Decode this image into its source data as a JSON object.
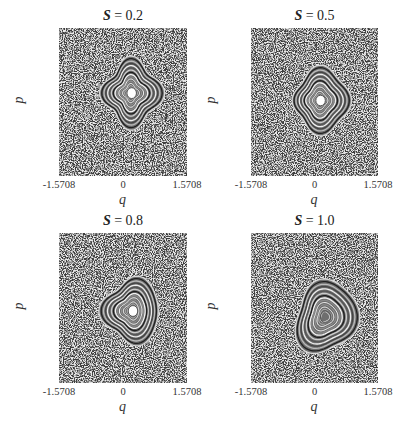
{
  "figure": {
    "panels": [
      {
        "title_symbol": "S",
        "title_eq": " = 0.2",
        "xlabel": "q",
        "ylabel": "p",
        "xticks": [
          "-1.5708",
          "0",
          "1.5708"
        ],
        "yticks": [
          "1.5708",
          "0",
          "-1.5708"
        ]
      },
      {
        "title_symbol": "S",
        "title_eq": " = 0.5",
        "xlabel": "q",
        "ylabel": "p",
        "xticks": [
          "-1.5708",
          "0",
          "1.5708"
        ],
        "yticks": [
          "1.5708",
          "0",
          "-1.5708"
        ]
      },
      {
        "title_symbol": "S",
        "title_eq": " = 0.8",
        "xlabel": "q",
        "ylabel": "p",
        "xticks": [
          "-1.5708",
          "0",
          "1.5708"
        ],
        "yticks": [
          "1.5708",
          "0",
          "-1.5708"
        ]
      },
      {
        "title_symbol": "S",
        "title_eq": " = 1.0",
        "xlabel": "q",
        "ylabel": "p",
        "xticks": [
          "-1.5708",
          "0",
          "1.5708"
        ],
        "yticks": [
          "1.5708",
          "0",
          "-1.5708"
        ]
      }
    ]
  },
  "chart_data": [
    {
      "type": "scatter",
      "title": "S = 0.2",
      "xlabel": "q",
      "ylabel": "p",
      "xlim": [
        -1.5708,
        1.5708
      ],
      "ylim": [
        -1.5708,
        1.5708
      ],
      "x_ticks": [
        -1.5708,
        0,
        1.5708
      ],
      "y_ticks": [
        -1.5708,
        0,
        1.5708
      ],
      "description": "Poincare section: chaotic sea with a regular island (nested invariant curves) centered near q=0.15, p=0.1",
      "island": {
        "center": [
          0.15,
          0.1
        ],
        "half_width": 0.55,
        "half_height": 0.6,
        "shape": "squarish with cusps at corners"
      }
    },
    {
      "type": "scatter",
      "title": "S = 0.5",
      "xlabel": "q",
      "ylabel": "p",
      "xlim": [
        -1.5708,
        1.5708
      ],
      "ylim": [
        -1.5708,
        1.5708
      ],
      "x_ticks": [
        -1.5708,
        0,
        1.5708
      ],
      "y_ticks": [
        -1.5708,
        0,
        1.5708
      ],
      "description": "Poincare section: chaotic sea with a regular island centered near q=0.1, p=0.0",
      "island": {
        "center": [
          0.1,
          0.0
        ],
        "half_width": 0.55,
        "half_height": 0.6,
        "shape": "D-shaped"
      }
    },
    {
      "type": "scatter",
      "title": "S = 0.8",
      "xlabel": "q",
      "ylabel": "p",
      "xlim": [
        -1.5708,
        1.5708
      ],
      "ylim": [
        -1.5708,
        1.5708
      ],
      "x_ticks": [
        -1.5708,
        0,
        1.5708
      ],
      "y_ticks": [
        -1.5708,
        0,
        1.5708
      ],
      "description": "Poincare section: chaotic sea with a regular island centered near q=0.2, p=-0.1",
      "island": {
        "center": [
          0.2,
          -0.1
        ],
        "half_width": 0.55,
        "half_height": 0.6,
        "shape": "rounded triangle"
      }
    },
    {
      "type": "scatter",
      "title": "S = 1.0",
      "xlabel": "q",
      "ylabel": "p",
      "xlim": [
        -1.5708,
        1.5708
      ],
      "ylim": [
        -1.5708,
        1.5708
      ],
      "x_ticks": [
        -1.5708,
        0,
        1.5708
      ],
      "y_ticks": [
        -1.5708,
        0,
        1.5708
      ],
      "description": "Poincare section: chaotic sea with a regular island centered near q=0.25, p=-0.25",
      "island": {
        "center": [
          0.25,
          -0.25
        ],
        "half_width": 0.6,
        "half_height": 0.7,
        "shape": "irregular kidney"
      }
    }
  ],
  "layout": {
    "panels": [
      {
        "x": 59,
        "y": 28,
        "w": 128,
        "h": 148,
        "cx": 0.56,
        "cy": 0.44,
        "rx": 28,
        "ry": 32,
        "kind": 0
      },
      {
        "x": 251,
        "y": 28,
        "w": 127,
        "h": 148,
        "cx": 0.54,
        "cy": 0.49,
        "rx": 28,
        "ry": 31,
        "kind": 1
      },
      {
        "x": 59,
        "y": 233,
        "w": 128,
        "h": 150,
        "cx": 0.57,
        "cy": 0.52,
        "rx": 28,
        "ry": 32,
        "kind": 2
      },
      {
        "x": 251,
        "y": 233,
        "w": 127,
        "h": 150,
        "cx": 0.58,
        "cy": 0.56,
        "rx": 31,
        "ry": 36,
        "kind": 3
      }
    ]
  }
}
